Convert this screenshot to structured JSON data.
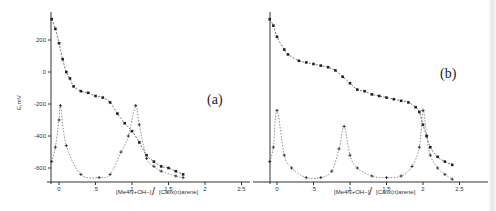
{
  "chart_data": [
    {
      "type": "line",
      "panel_label": "(a)",
      "ylabel": "E,mV",
      "xlabel_num": "[Me4N+OH−]",
      "xlabel_den": "[Calix(n)arene]",
      "xlabel": "[Me4N+OH−]/[Calix(n)arene]",
      "x_ticks": [
        "0",
        ".5",
        "1",
        "1.5",
        "2",
        "2.5"
      ],
      "x_tick_values": [
        0,
        0.5,
        1,
        1.5,
        2,
        2.5
      ],
      "y_ticks": [
        "200",
        "0",
        "-200",
        "-400",
        "-600"
      ],
      "y_tick_values": [
        200,
        0,
        -200,
        -400,
        -600
      ],
      "xlim": [
        -0.11,
        2.6
      ],
      "ylim": [
        -690,
        350
      ],
      "series": [
        {
          "name": "E (potential)",
          "marker": "dot",
          "x": [
            -0.1,
            -0.05,
            0.0,
            0.05,
            0.1,
            0.15,
            0.2,
            0.3,
            0.4,
            0.5,
            0.6,
            0.7,
            0.8,
            0.9,
            1.0,
            1.1,
            1.2,
            1.3,
            1.4,
            1.5,
            1.6,
            1.7
          ],
          "values": [
            330,
            270,
            180,
            80,
            0,
            -40,
            -90,
            -120,
            -130,
            -150,
            -160,
            -190,
            -260,
            -320,
            -370,
            -440,
            -520,
            -560,
            -590,
            -600,
            -620,
            -640
          ]
        },
        {
          "name": "dE/dV (derivative)",
          "marker": "plus",
          "x": [
            -0.1,
            -0.05,
            0.0,
            0.02,
            0.1,
            0.3,
            0.55,
            0.7,
            0.85,
            0.95,
            1.05,
            1.1,
            1.2,
            1.3,
            1.4,
            1.6,
            1.7
          ],
          "values": [
            -560,
            -470,
            -300,
            -210,
            -460,
            -640,
            -660,
            -640,
            -500,
            -400,
            -210,
            -330,
            -540,
            -590,
            -620,
            -650,
            -660
          ]
        }
      ]
    },
    {
      "type": "line",
      "panel_label": "(b)",
      "ylabel": "",
      "xlabel_num": "[Me4N+OH−]",
      "xlabel_den": "[Calix(n)arene]",
      "xlabel": "[Me4N+OH−]/[Calix(n)arene]",
      "x_ticks": [
        "0",
        ".5",
        "1",
        "1.5",
        "2",
        "2.5"
      ],
      "x_tick_values": [
        0,
        0.5,
        1,
        1.5,
        2,
        2.5
      ],
      "y_ticks": [],
      "y_tick_values": [
        200,
        0,
        -200,
        -400,
        -600
      ],
      "xlim": [
        -0.1,
        2.6
      ],
      "ylim": [
        -690,
        350
      ],
      "series": [
        {
          "name": "E (potential)",
          "marker": "dot",
          "x": [
            -0.1,
            -0.05,
            0.0,
            0.1,
            0.15,
            0.3,
            0.4,
            0.5,
            0.6,
            0.7,
            0.8,
            0.9,
            1.0,
            1.1,
            1.2,
            1.3,
            1.4,
            1.5,
            1.6,
            1.7,
            1.8,
            1.9,
            1.95,
            2.0,
            2.05,
            2.1,
            2.2,
            2.3,
            2.4
          ],
          "values": [
            330,
            290,
            220,
            140,
            110,
            70,
            60,
            50,
            40,
            30,
            10,
            -30,
            -70,
            -110,
            -120,
            -140,
            -150,
            -160,
            -170,
            -180,
            -190,
            -220,
            -250,
            -330,
            -400,
            -470,
            -530,
            -560,
            -580
          ]
        },
        {
          "name": "dE/dV (derivative)",
          "marker": "plus",
          "x": [
            -0.1,
            -0.05,
            0.0,
            0.1,
            0.2,
            0.4,
            0.6,
            0.75,
            0.85,
            0.92,
            1.0,
            1.1,
            1.3,
            1.5,
            1.7,
            1.85,
            1.95,
            2.0,
            2.05,
            2.1,
            2.2,
            2.3,
            2.4
          ],
          "values": [
            -560,
            -470,
            -240,
            -520,
            -600,
            -660,
            -660,
            -620,
            -480,
            -340,
            -520,
            -600,
            -650,
            -660,
            -650,
            -590,
            -470,
            -240,
            -400,
            -520,
            -600,
            -640,
            -670
          ]
        }
      ]
    }
  ]
}
